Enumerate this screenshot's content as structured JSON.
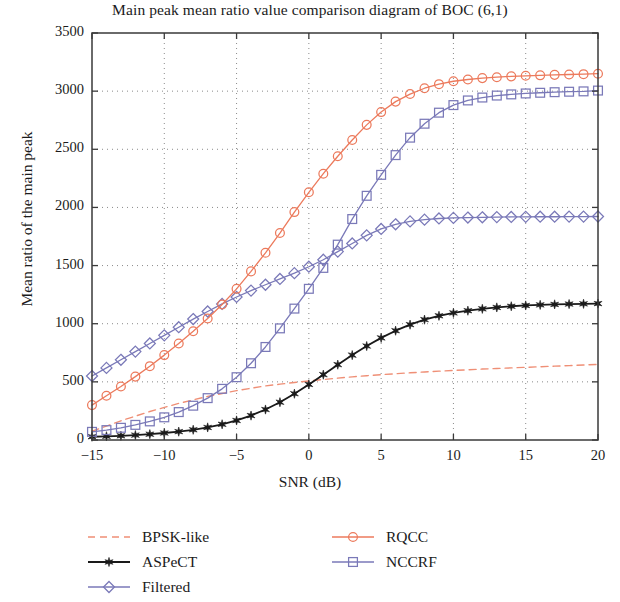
{
  "chart_data": {
    "type": "line",
    "title": "Main peak mean ratio value comparison diagram of BOC (6,1)",
    "xlabel": "SNR (dB)",
    "ylabel": "Mean ratio of the main peak",
    "xlim": [
      -15,
      20
    ],
    "ylim": [
      0,
      3500
    ],
    "xticks": [
      -15,
      -10,
      -5,
      0,
      5,
      10,
      15,
      20
    ],
    "xtick_labels": [
      "−15",
      "−10",
      "−5",
      "0",
      "5",
      "10",
      "15",
      "20"
    ],
    "yticks": [
      0,
      500,
      1000,
      1500,
      2000,
      2500,
      3000,
      3500
    ],
    "ytick_labels": [
      "0",
      "500",
      "1000",
      "1500",
      "2000",
      "2500",
      "3000",
      "3500"
    ],
    "grid": true,
    "grid_style": "dotted",
    "legend_position": "below-axes",
    "x": [
      -15,
      -14,
      -13,
      -12,
      -11,
      -10,
      -9,
      -8,
      -7,
      -6,
      -5,
      -4,
      -3,
      -2,
      -1,
      0,
      1,
      2,
      3,
      4,
      5,
      6,
      7,
      8,
      9,
      10,
      11,
      12,
      13,
      14,
      15,
      16,
      17,
      18,
      19,
      20
    ],
    "series": [
      {
        "name": "BPSK-like",
        "color": "#ef8f76",
        "line": "dashed",
        "marker": "none",
        "values": [
          75,
          120,
          165,
          205,
          245,
          280,
          315,
          345,
          375,
          400,
          425,
          445,
          465,
          480,
          495,
          508,
          520,
          532,
          543,
          553,
          562,
          570,
          578,
          585,
          592,
          598,
          604,
          610,
          615,
          620,
          625,
          630,
          635,
          640,
          645,
          650
        ]
      },
      {
        "name": "ASPeCT",
        "color": "#1a1a1a",
        "line": "solid",
        "marker": "star",
        "values": [
          28,
          32,
          36,
          42,
          50,
          60,
          72,
          88,
          108,
          135,
          168,
          210,
          262,
          325,
          398,
          478,
          562,
          648,
          730,
          808,
          878,
          940,
          992,
          1035,
          1068,
          1093,
          1112,
          1128,
          1140,
          1150,
          1157,
          1162,
          1166,
          1169,
          1171,
          1173
        ]
      },
      {
        "name": "Filtered",
        "color": "#7a79b8",
        "line": "solid",
        "marker": "diamond",
        "values": [
          550,
          620,
          690,
          760,
          830,
          900,
          970,
          1040,
          1105,
          1170,
          1230,
          1285,
          1335,
          1385,
          1435,
          1490,
          1550,
          1620,
          1690,
          1760,
          1815,
          1855,
          1880,
          1895,
          1905,
          1910,
          1913,
          1915,
          1917,
          1918,
          1919,
          1920,
          1920,
          1921,
          1921,
          1922
        ]
      },
      {
        "name": "RQCC",
        "color": "#ec7a5c",
        "line": "solid",
        "marker": "circle",
        "values": [
          300,
          380,
          460,
          545,
          635,
          730,
          830,
          935,
          1045,
          1165,
          1300,
          1450,
          1610,
          1780,
          1960,
          2130,
          2290,
          2440,
          2580,
          2710,
          2820,
          2910,
          2975,
          3025,
          3060,
          3085,
          3100,
          3112,
          3120,
          3127,
          3132,
          3136,
          3140,
          3143,
          3146,
          3150
        ]
      },
      {
        "name": "NCCRF",
        "color": "#7a79b8",
        "line": "solid",
        "marker": "square",
        "values": [
          70,
          85,
          105,
          130,
          160,
          195,
          240,
          295,
          360,
          440,
          540,
          660,
          800,
          960,
          1130,
          1300,
          1480,
          1680,
          1900,
          2100,
          2280,
          2450,
          2600,
          2720,
          2815,
          2880,
          2920,
          2945,
          2962,
          2972,
          2980,
          2986,
          2991,
          2995,
          2998,
          3005
        ]
      }
    ]
  },
  "legend": {
    "entries": [
      {
        "label": "BPSK-like",
        "color": "#ef8f76",
        "style": "dashed",
        "marker": "none"
      },
      {
        "label": "ASPeCT",
        "color": "#1a1a1a",
        "style": "solid",
        "marker": "star"
      },
      {
        "label": "Filtered",
        "color": "#7a79b8",
        "style": "solid",
        "marker": "diamond"
      },
      {
        "label": "RQCC",
        "color": "#ec7a5c",
        "style": "solid",
        "marker": "circle"
      },
      {
        "label": "NCCRF",
        "color": "#7a79b8",
        "style": "solid",
        "marker": "square"
      }
    ]
  },
  "colors": {
    "axis": "#3a3a3a",
    "grid": "#8a8a8a",
    "background": "#ffffff",
    "text": "#1b1b1b"
  }
}
